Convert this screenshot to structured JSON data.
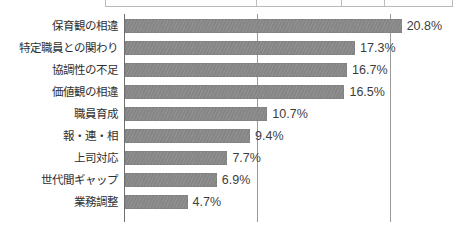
{
  "top_table_sliver": {
    "name": "clipped-table-above-chart",
    "divider_positions_px": [
      150,
      235,
      278
    ]
  },
  "chart_data": {
    "type": "bar",
    "orientation": "horizontal",
    "title": "",
    "subtitle": "",
    "xlabel": "",
    "ylabel": "",
    "xlim": [
      0,
      22.4
    ],
    "grid": true,
    "gridlines_at": [
      0,
      10,
      20
    ],
    "legend": "none",
    "bar_color": "#8b8b8b",
    "value_suffix": "%",
    "categories": [
      "保育観の相違",
      "特定職員との関わり",
      "協調性の不足",
      "価値観の相違",
      "職員育成",
      "報・連・相",
      "上司対応",
      "世代間ギャップ",
      "業務調整"
    ],
    "values": [
      20.8,
      17.3,
      16.7,
      16.5,
      10.7,
      9.4,
      7.7,
      6.9,
      4.7
    ],
    "value_labels": [
      "20.8%",
      "17.3%",
      "16.7%",
      "16.5%",
      "10.7%",
      "9.4%",
      "7.7%",
      "6.9%",
      "4.7%"
    ]
  }
}
